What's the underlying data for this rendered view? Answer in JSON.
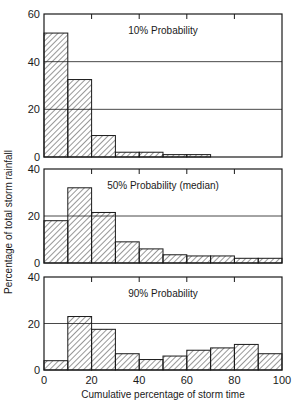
{
  "chart_data": {
    "type": "bar",
    "layout": "three stacked histogram panels sharing x-axis",
    "xlabel": "Cumulative percentage of storm time",
    "ylabel": "Percentage of total storm rainfall",
    "x_ticks": [
      0,
      20,
      40,
      60,
      80,
      100
    ],
    "xlim": [
      0,
      100
    ],
    "bin_edges": [
      0,
      10,
      20,
      30,
      40,
      50,
      60,
      70,
      80,
      90,
      100
    ],
    "categories": [
      "0-10",
      "10-20",
      "20-30",
      "30-40",
      "40-50",
      "50-60",
      "60-70",
      "70-80",
      "80-90",
      "90-100"
    ],
    "grid": "horizontal lines at y=20 and y=40",
    "bar_fill": "diagonal hatch",
    "panels": [
      {
        "title": "10% Probability",
        "ylim": [
          0,
          60
        ],
        "y_ticks": [
          0,
          20,
          40,
          60
        ],
        "values": [
          52,
          32.5,
          9,
          2,
          2,
          1,
          1,
          0,
          0,
          0
        ]
      },
      {
        "title": "50% Probability (median)",
        "ylim": [
          0,
          40
        ],
        "y_ticks": [
          0,
          20,
          40
        ],
        "values": [
          18,
          32,
          21.5,
          9,
          6,
          3.5,
          3,
          3,
          2,
          2
        ]
      },
      {
        "title": "90% Probability",
        "ylim": [
          0,
          40
        ],
        "y_ticks": [
          0,
          20,
          40
        ],
        "values": [
          4,
          23,
          17.5,
          7,
          4.5,
          6,
          8.5,
          9.5,
          11,
          7
        ]
      }
    ]
  },
  "colors": {
    "ink": "#1a1a1a",
    "background": "#ffffff"
  }
}
